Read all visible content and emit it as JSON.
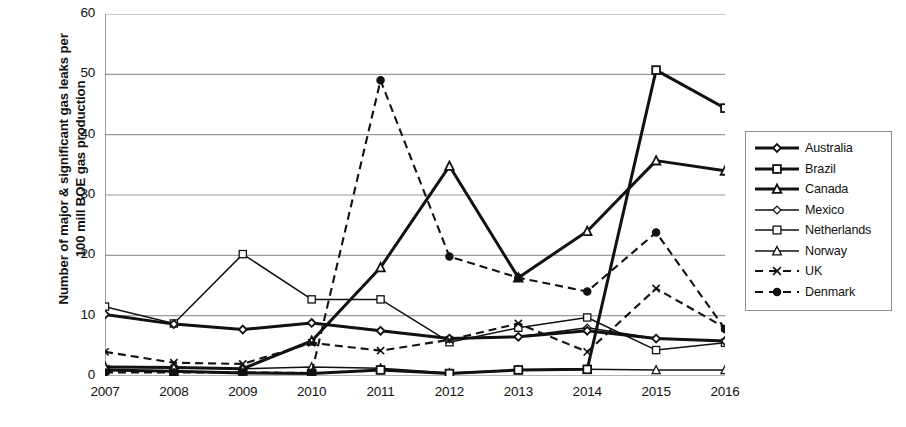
{
  "chart_data": {
    "type": "line",
    "title": "",
    "xlabel": "",
    "ylabel": "Number of major & significant gas leaks per 100 mill BOE gas production",
    "ylabel_line1": "Number of major & significant gas leaks per",
    "ylabel_line2": "100 mill BOE gas production",
    "categories": [
      "2007",
      "2008",
      "2009",
      "2010",
      "2011",
      "2012",
      "2013",
      "2014",
      "2015",
      "2016"
    ],
    "ylim": [
      0,
      60
    ],
    "yticks": [
      0,
      10,
      20,
      30,
      40,
      50,
      60
    ],
    "grid": "horizontal",
    "legend_position": "right",
    "series": [
      {
        "name": "Australia",
        "marker": "diamond",
        "marker_fill": "open",
        "line": "solid",
        "line_weight": "thick",
        "values": [
          10.2,
          8.6,
          7.7,
          8.8,
          7.5,
          6.2,
          6.5,
          7.5,
          6.2,
          5.8
        ]
      },
      {
        "name": "Brazil",
        "marker": "square",
        "marker_fill": "open",
        "line": "solid",
        "line_weight": "thick",
        "values": [
          1.0,
          0.8,
          0.5,
          0.4,
          1.0,
          0.4,
          1.0,
          1.1,
          50.7,
          44.4
        ]
      },
      {
        "name": "Canada",
        "marker": "triangle",
        "marker_fill": "open",
        "line": "solid",
        "line_weight": "thick",
        "values": [
          1.5,
          1.4,
          1.2,
          5.8,
          18.0,
          34.8,
          16.3,
          24.0,
          35.7,
          34.0
        ]
      },
      {
        "name": "Mexico",
        "marker": "diamond",
        "marker_fill": "open",
        "line": "solid",
        "line_weight": "thin",
        "values": [
          10.2,
          8.6,
          7.7,
          8.8,
          7.5,
          6.2,
          6.5,
          8.0,
          6.2,
          5.8
        ]
      },
      {
        "name": "Netherlands",
        "marker": "square",
        "marker_fill": "open",
        "line": "solid",
        "line_weight": "thin",
        "values": [
          11.5,
          8.7,
          20.2,
          12.7,
          12.7,
          5.6,
          8.0,
          9.7,
          4.3,
          5.5
        ]
      },
      {
        "name": "Norway",
        "marker": "triangle",
        "marker_fill": "open",
        "line": "solid",
        "line_weight": "thin",
        "values": [
          1.5,
          1.4,
          1.2,
          1.5,
          1.3,
          0.5,
          1.0,
          1.1,
          1.0,
          1.0
        ]
      },
      {
        "name": "UK",
        "marker": "x",
        "marker_fill": "open",
        "line": "dashed",
        "line_weight": "thin",
        "values": [
          4.0,
          2.2,
          2.0,
          5.5,
          4.2,
          6.0,
          8.7,
          4.0,
          14.5,
          8.0
        ]
      },
      {
        "name": "Denmark",
        "marker": "circle",
        "marker_fill": "filled",
        "line": "dashed",
        "line_weight": "thin",
        "values": [
          0.6,
          0.6,
          0.6,
          0.5,
          49.0,
          19.8,
          16.3,
          14.0,
          23.8,
          7.8
        ]
      }
    ]
  },
  "axis": {
    "y_ticks": [
      "0",
      "10",
      "20",
      "30",
      "40",
      "50",
      "60"
    ],
    "x_ticks": [
      "2007",
      "2008",
      "2009",
      "2010",
      "2011",
      "2012",
      "2013",
      "2014",
      "2015",
      "2016"
    ]
  },
  "legend": {
    "items": [
      {
        "label": "Australia"
      },
      {
        "label": "Brazil"
      },
      {
        "label": "Canada"
      },
      {
        "label": "Mexico"
      },
      {
        "label": "Netherlands"
      },
      {
        "label": "Norway"
      },
      {
        "label": "UK"
      },
      {
        "label": "Denmark"
      }
    ]
  },
  "colors": {
    "line": "#111111",
    "grid": "#9a9a9a",
    "axis": "#6f6f6f",
    "background": "#ffffff"
  }
}
